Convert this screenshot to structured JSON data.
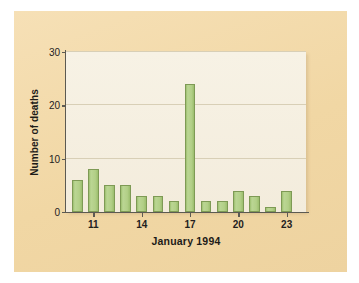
{
  "figure": {
    "card_background": "#f3dbac",
    "plot_background": "#f5efe0",
    "bar_fill": "#acca80",
    "bar_border": "#7e9a55",
    "grid_color": "#d8cfb6",
    "axis_color": "#5c5a52"
  },
  "axes": {
    "y_title": "Number of deaths",
    "x_title": "January 1994",
    "y_ticks": [
      "0",
      "10",
      "20",
      "30"
    ],
    "x_ticks": [
      "11",
      "14",
      "17",
      "20",
      "23"
    ]
  },
  "chart_data": {
    "type": "bar",
    "title": "",
    "subtitle": "",
    "xlabel": "January 1994",
    "ylabel": "Number of deaths",
    "categories": [
      "10",
      "11",
      "12",
      "13",
      "14",
      "15",
      "16",
      "17",
      "18",
      "19",
      "20",
      "21",
      "22",
      "23",
      "24",
      "25"
    ],
    "values": [
      6,
      8,
      5,
      5,
      3,
      3,
      2,
      24,
      2,
      2,
      4,
      3,
      1,
      4,
      0,
      0
    ],
    "series": [
      {
        "name": "Number of deaths",
        "values": [
          6,
          8,
          5,
          5,
          3,
          3,
          2,
          24,
          2,
          2,
          4,
          3,
          1,
          4,
          0,
          0
        ]
      }
    ],
    "xlim": [
      9.3,
      24.2
    ],
    "ylim": [
      0,
      30
    ],
    "y_tick_values": [
      0,
      10,
      20,
      30
    ],
    "x_tick_values": [
      11,
      14,
      17,
      20,
      23
    ],
    "grid": "horizontal",
    "legend": "none",
    "bar_color": "#acca80",
    "bar_edge_color": "#7e9a55",
    "annotations": []
  }
}
